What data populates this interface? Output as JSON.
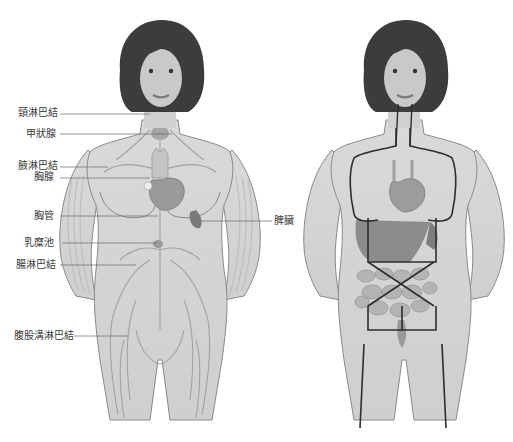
{
  "figure": {
    "left_panel": {
      "description": "Lymphatic system (female front view)",
      "labels": [
        {
          "id": "cervical",
          "text": "頸淋巴結",
          "x": 18,
          "y": 107,
          "line_to_x": 150,
          "line_y": 114
        },
        {
          "id": "thyroid",
          "text": "甲狀腺",
          "x": 26,
          "y": 128,
          "line_to_x": 172,
          "line_y": 134
        },
        {
          "id": "axillary",
          "text": "腋淋巴結",
          "x": 18,
          "y": 160,
          "line_to_x": 108,
          "line_y": 167
        },
        {
          "id": "thymus",
          "text": "胸腺",
          "x": 34,
          "y": 171,
          "line_to_x": 150,
          "line_y": 178
        },
        {
          "id": "thoracic_duct",
          "text": "胸管",
          "x": 34,
          "y": 210,
          "line_to_x": 158,
          "line_y": 216
        },
        {
          "id": "cisterna_chyli",
          "text": "乳糜池",
          "x": 24,
          "y": 238,
          "line_to_x": 156,
          "line_y": 243
        },
        {
          "id": "intestinal",
          "text": "腸淋巴結",
          "x": 16,
          "y": 258,
          "line_to_x": 136,
          "line_y": 265
        },
        {
          "id": "inguinal",
          "text": "腹股溝淋巴結",
          "x": 14,
          "y": 330,
          "line_to_x": 128,
          "line_y": 336
        }
      ],
      "right_labels": [
        {
          "id": "spleen",
          "text": "脾臟",
          "x": 274,
          "y": 216,
          "line_from_x": 196,
          "line_y": 221
        }
      ]
    },
    "right_panel": {
      "description": "Internal organs (female front view) with outlined regions"
    },
    "colors": {
      "skin": "#d4d4d4",
      "skin_outline": "#8a8a8a",
      "hair": "#3c3c3c",
      "organ": "#9c9c9c",
      "organ_dark": "#7a7a7a",
      "vessel": "#a8a8a8",
      "outline_dark": "#2e2e2e",
      "label_text": "#3a3a3a",
      "leader_line": "#6a6a6a"
    }
  }
}
